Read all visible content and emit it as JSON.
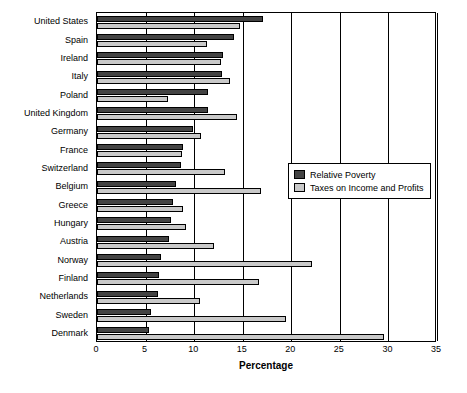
{
  "chart_data": {
    "type": "bar",
    "orientation": "horizontal",
    "title": "",
    "xlabel": "Percentage",
    "ylabel": "",
    "xlim": [
      0,
      35
    ],
    "xticks": [
      0,
      5,
      10,
      15,
      20,
      25,
      30,
      35
    ],
    "grid": true,
    "legend_position": "middle-right",
    "categories": [
      "United States",
      "Spain",
      "Ireland",
      "Italy",
      "Poland",
      "United Kingdom",
      "Germany",
      "France",
      "Switzerland",
      "Belgium",
      "Greece",
      "Hungary",
      "Austria",
      "Norway",
      "Finland",
      "Netherlands",
      "Sweden",
      "Denmark"
    ],
    "series": [
      {
        "name": "Relative Poverty",
        "color": "#434343",
        "values": [
          17.1,
          14.1,
          13.0,
          12.9,
          11.4,
          11.4,
          9.9,
          8.9,
          8.6,
          8.1,
          7.8,
          7.6,
          7.4,
          6.6,
          6.4,
          6.3,
          5.6,
          5.4
        ]
      },
      {
        "name": "Taxes on Income and Profits",
        "color": "#c9c9c9",
        "values": [
          14.7,
          11.3,
          12.8,
          13.7,
          7.3,
          14.4,
          10.7,
          8.8,
          13.2,
          16.9,
          8.9,
          9.2,
          12.0,
          22.1,
          16.7,
          10.6,
          19.5,
          29.5
        ]
      }
    ]
  },
  "legend": {
    "items": [
      {
        "label": "Relative Poverty"
      },
      {
        "label": "Taxes on Income and Profits"
      }
    ]
  },
  "axis": {
    "x_title": "Percentage"
  }
}
